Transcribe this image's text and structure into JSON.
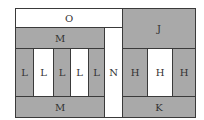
{
  "diagram": {
    "colors": {
      "gray": "#a9a9a9",
      "white": "#ffffff",
      "border": "#3a3a3a"
    },
    "cells": [
      {
        "id": "O",
        "label": "O",
        "fill": "white",
        "x": 15,
        "y": 8,
        "w": 108,
        "h": 20
      },
      {
        "id": "M_top",
        "label": "M",
        "fill": "gray",
        "x": 15,
        "y": 27,
        "w": 90,
        "h": 22
      },
      {
        "id": "L1",
        "label": "L",
        "fill": "gray",
        "x": 15,
        "y": 48,
        "w": 19,
        "h": 49
      },
      {
        "id": "L2",
        "label": "L",
        "fill": "white",
        "x": 33,
        "y": 48,
        "w": 21,
        "h": 49
      },
      {
        "id": "L3",
        "label": "L",
        "fill": "gray",
        "x": 53,
        "y": 48,
        "w": 18,
        "h": 49
      },
      {
        "id": "L4",
        "label": "L",
        "fill": "white",
        "x": 70,
        "y": 48,
        "w": 19,
        "h": 49
      },
      {
        "id": "L5",
        "label": "L",
        "fill": "gray",
        "x": 88,
        "y": 48,
        "w": 17,
        "h": 49
      },
      {
        "id": "M_bottom",
        "label": "M",
        "fill": "gray",
        "x": 15,
        "y": 96,
        "w": 90,
        "h": 22
      },
      {
        "id": "N",
        "label": "N",
        "fill": "white",
        "x": 104,
        "y": 27,
        "w": 19,
        "h": 91
      },
      {
        "id": "J",
        "label": "J",
        "fill": "gray",
        "x": 122,
        "y": 8,
        "w": 74,
        "h": 41
      },
      {
        "id": "H1",
        "label": "H",
        "fill": "gray",
        "x": 122,
        "y": 48,
        "w": 26,
        "h": 49
      },
      {
        "id": "H2",
        "label": "H",
        "fill": "white",
        "x": 147,
        "y": 48,
        "w": 26,
        "h": 49
      },
      {
        "id": "H3",
        "label": "H",
        "fill": "gray",
        "x": 172,
        "y": 48,
        "w": 24,
        "h": 49
      },
      {
        "id": "K",
        "label": "K",
        "fill": "gray",
        "x": 122,
        "y": 96,
        "w": 74,
        "h": 22
      }
    ]
  }
}
